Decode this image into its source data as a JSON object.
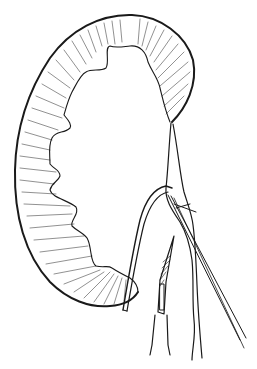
{
  "figure": {
    "colors": {
      "ink": "#1a1a1a",
      "background": "#ffffff"
    }
  },
  "components": [
    {
      "id": "kidney",
      "label": "kidney-cortex"
    },
    {
      "id": "retractor",
      "label": "retractor"
    },
    {
      "id": "scalpel",
      "label": "scalpel"
    },
    {
      "id": "ureter",
      "label": "ureter"
    },
    {
      "id": "needle",
      "label": "suture-needle"
    }
  ]
}
